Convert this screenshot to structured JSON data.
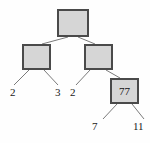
{
  "figure": {
    "background_color": "#fefefe",
    "node_fill_color": "#d6d6d6",
    "node_border_color": "#4a4a4a",
    "edge_color": "#7a7a7a",
    "label_color": "#1a1a1a"
  },
  "tree": {
    "nodes": [
      {
        "id": "root",
        "label": "",
        "x": 57,
        "y": 9,
        "w": 32,
        "h": 28
      },
      {
        "id": "left",
        "label": "",
        "x": 22,
        "y": 44,
        "w": 29,
        "h": 26
      },
      {
        "id": "right",
        "label": "",
        "x": 84,
        "y": 44,
        "w": 29,
        "h": 26
      },
      {
        "id": "right-right",
        "label": "77",
        "x": 110,
        "y": 78,
        "w": 29,
        "h": 26
      }
    ],
    "leaves": [
      {
        "id": "leaf-1",
        "label": "2",
        "x": 10,
        "y": 87
      },
      {
        "id": "leaf-2",
        "label": "3",
        "x": 55,
        "y": 87
      },
      {
        "id": "leaf-3",
        "label": "2",
        "x": 70,
        "y": 87
      },
      {
        "id": "leaf-4",
        "label": "7",
        "x": 92,
        "y": 121
      },
      {
        "id": "leaf-5",
        "label": "11",
        "x": 133,
        "y": 121
      }
    ],
    "edges": [
      {
        "id": "edge-root-left",
        "x1": 68,
        "y1": 37,
        "x2": 42,
        "y2": 44
      },
      {
        "id": "edge-root-right",
        "x1": 78,
        "y1": 37,
        "x2": 95,
        "y2": 44
      },
      {
        "id": "edge-left-leaf1",
        "x1": 29,
        "y1": 70,
        "x2": 14,
        "y2": 85
      },
      {
        "id": "edge-left-leaf2",
        "x1": 44,
        "y1": 70,
        "x2": 58,
        "y2": 85
      },
      {
        "id": "edge-right-leaf3",
        "x1": 90,
        "y1": 70,
        "x2": 76,
        "y2": 85
      },
      {
        "id": "edge-right-rightright",
        "x1": 106,
        "y1": 70,
        "x2": 120,
        "y2": 78
      },
      {
        "id": "edge-rr-leaf4",
        "x1": 117,
        "y1": 104,
        "x2": 103,
        "y2": 119
      },
      {
        "id": "edge-rr-leaf5",
        "x1": 132,
        "y1": 104,
        "x2": 144,
        "y2": 119
      }
    ]
  }
}
